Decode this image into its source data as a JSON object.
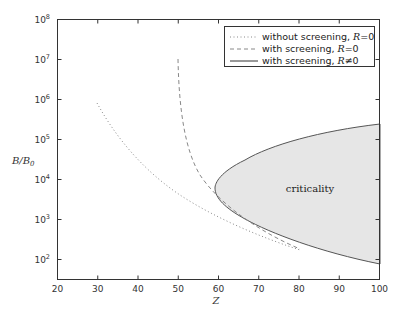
{
  "chart_data": {
    "type": "line",
    "title": "",
    "xlabel": "Z",
    "ylabel": "B/B_0",
    "xlim": [
      20,
      100
    ],
    "ylim_log10": [
      1.5,
      8
    ],
    "yscale": "log",
    "x_ticks": [
      "20",
      "30",
      "40",
      "50",
      "60",
      "70",
      "80",
      "90",
      "100"
    ],
    "y_ticks": [
      {
        "base": "10",
        "exp": "2"
      },
      {
        "base": "10",
        "exp": "3"
      },
      {
        "base": "10",
        "exp": "4"
      },
      {
        "base": "10",
        "exp": "5"
      },
      {
        "base": "10",
        "exp": "6"
      },
      {
        "base": "10",
        "exp": "7"
      },
      {
        "base": "10",
        "exp": "8"
      }
    ],
    "grid": false,
    "legend_position": "upper right",
    "series": [
      {
        "name": "without screening, R=0",
        "style": "dotted",
        "x": [
          30,
          35,
          40,
          45,
          50,
          55,
          60,
          65,
          70,
          75
        ],
        "log10_y": [
          5.9,
          5.2,
          4.65,
          4.2,
          3.85,
          3.5,
          3.2,
          2.95,
          2.75,
          2.55
        ]
      },
      {
        "name": "with screening, R=0",
        "style": "dashed",
        "x": [
          50,
          50.5,
          51,
          52,
          54,
          57,
          60,
          65,
          70,
          75
        ],
        "log10_y": [
          7.0,
          6.0,
          5.4,
          4.85,
          4.3,
          3.8,
          3.45,
          3.05,
          2.75,
          2.55
        ]
      },
      {
        "name": "with screening, R≠0",
        "style": "solid",
        "x": [
          59.3,
          65,
          70,
          75,
          80,
          85,
          90,
          95,
          100
        ],
        "log10_y_upper": [
          3.78,
          4.3,
          4.55,
          4.75,
          4.9,
          5.0,
          5.1,
          5.2,
          5.39
        ],
        "log10_y_lower": [
          3.78,
          3.15,
          2.85,
          2.62,
          2.45,
          2.3,
          2.15,
          2.0,
          1.87
        ]
      }
    ],
    "annotations": [
      {
        "text": "criticality",
        "x": 80,
        "log10_y": 3.9
      }
    ],
    "legend": {
      "entries": [
        {
          "label": "without screening, ",
          "var": "R",
          "rel": "=0"
        },
        {
          "label": "with screening, ",
          "var": "R",
          "rel": "=0"
        },
        {
          "label": "with screening, ",
          "var": "R",
          "rel": "≠0"
        }
      ]
    },
    "fill_color": "#e8e8e8"
  }
}
